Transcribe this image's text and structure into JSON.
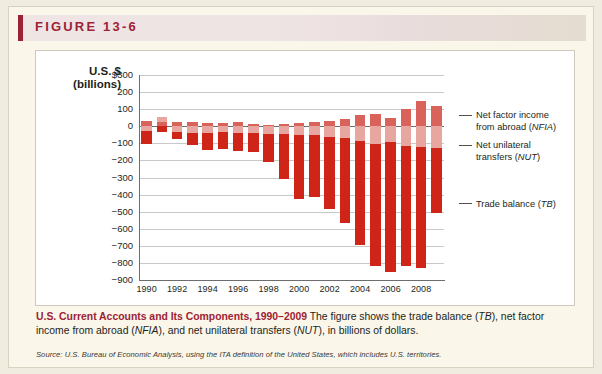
{
  "figure": {
    "header_label": "FIGURE 13-6",
    "accent_color": "#9d2235"
  },
  "caption": {
    "title": "U.S. Current Accounts and Its Components, 1990–2009",
    "body_part1": " The figure shows the trade balance (",
    "abbr_tb": "TB",
    "body_part2": "), net factor income from abroad (",
    "abbr_nfia": "NFIA",
    "body_part3": "), and net unilateral transfers (",
    "abbr_nut": "NUT",
    "body_part4": "), in billions of dollars.",
    "source": "Source: U.S. Bureau of Economic Analysis, using the ITA definition of the United States, which includes U.S. territories."
  },
  "legend": {
    "items": [
      {
        "line1": "Net factor income",
        "line2": "from abroad (NFIA)",
        "key": "nfia",
        "color": "#d9625a"
      },
      {
        "line1": "Net unilateral",
        "line2": "transfers (NUT)",
        "key": "nut",
        "color": "#e8a6a0"
      },
      {
        "line1": "Trade balance (TB)",
        "line2": "",
        "key": "tb",
        "color": "#cf2418"
      }
    ]
  },
  "chart_data": {
    "type": "bar",
    "title": "U.S. Current Accounts and Its Components, 1990–2009",
    "subtitle": "",
    "stacked": true,
    "xlabel": "",
    "ylabel": "U.S. $ (billions)",
    "ylabel_line1": "U.S. $",
    "ylabel_line2": "(billions)",
    "ylim": [
      -900,
      300
    ],
    "ytick_values": [
      300,
      200,
      100,
      0,
      -100,
      -200,
      -300,
      -400,
      -500,
      -600,
      -700,
      -800,
      -900
    ],
    "ytick_labels": [
      "$300",
      "200",
      "100",
      "0",
      "−100",
      "−200",
      "−300",
      "−400",
      "−500",
      "−600",
      "−700",
      "−800",
      "−900"
    ],
    "grid": true,
    "legend_position": "right",
    "categories": [
      1990,
      1991,
      1992,
      1993,
      1994,
      1995,
      1996,
      1997,
      1998,
      1999,
      2000,
      2001,
      2002,
      2003,
      2004,
      2005,
      2006,
      2007,
      2008,
      2009
    ],
    "xtick_labels": [
      "1990",
      "1992",
      "1994",
      "1996",
      "1998",
      "2000",
      "2002",
      "2004",
      "2006",
      "2008"
    ],
    "series": [
      {
        "name": "Trade balance (TB)",
        "key": "tb",
        "color": "#cf2418",
        "values": [
          -80,
          -31,
          -39,
          -70,
          -98,
          -96,
          -104,
          -108,
          -166,
          -259,
          -372,
          -361,
          -418,
          -494,
          -610,
          -714,
          -762,
          -705,
          -708,
          -382
        ]
      },
      {
        "name": "Net unilateral transfers (NUT)",
        "key": "nut",
        "color": "#e8a6a0",
        "values": [
          -26,
          28,
          -35,
          -37,
          -40,
          -35,
          -40,
          -40,
          -44,
          -48,
          -54,
          -52,
          -64,
          -71,
          -88,
          -106,
          -92,
          -115,
          -122,
          -125
        ]
      },
      {
        "name": "Net factor income from abroad (NFIA)",
        "key": "nfia",
        "color": "#d9625a",
        "values": [
          29,
          25,
          25,
          26,
          18,
          21,
          23,
          14,
          9,
          14,
          18,
          26,
          28,
          45,
          68,
          73,
          48,
          101,
          146,
          121
        ]
      }
    ]
  }
}
